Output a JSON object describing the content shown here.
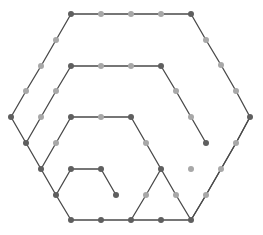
{
  "diagram": {
    "type": "hexagonal-spiral-path",
    "colors": {
      "edge": "#4a4a4a",
      "corner_node": "#5f5f5f",
      "mid_node": "#a8a8a8",
      "background": "#ffffff"
    },
    "path": [
      [
        116,
        195
      ],
      [
        101,
        169
      ],
      [
        71,
        169
      ],
      [
        56,
        195
      ],
      [
        71,
        220
      ],
      [
        101,
        220
      ],
      [
        131,
        220
      ],
      [
        161,
        220
      ],
      [
        191,
        220
      ],
      [
        206,
        195
      ],
      [
        221,
        169
      ],
      [
        236,
        143
      ],
      [
        250,
        117
      ],
      [
        236,
        91
      ],
      [
        221,
        65
      ],
      [
        206,
        40
      ],
      [
        191,
        14
      ],
      [
        161,
        14
      ],
      [
        131,
        14
      ],
      [
        101,
        14
      ],
      [
        71,
        14
      ],
      [
        56,
        40
      ],
      [
        41,
        66
      ],
      [
        26,
        91
      ],
      [
        11,
        117
      ],
      [
        26,
        143
      ],
      [
        41,
        169
      ],
      [
        56,
        195
      ]
    ],
    "path2": [
      [
        131,
        220
      ],
      [
        146,
        195
      ],
      [
        161,
        169
      ],
      [
        176,
        195
      ],
      [
        191,
        220
      ]
    ],
    "rings": [
      [
        [
          161,
          169
        ],
        [
          146,
          143
        ],
        [
          131,
          117
        ],
        [
          101,
          117
        ],
        [
          71,
          117
        ],
        [
          56,
          143
        ],
        [
          41,
          169
        ]
      ],
      [
        [
          191,
          220
        ],
        [
          206,
          195
        ],
        [
          221,
          169
        ],
        [
          236,
          143
        ],
        [
          250,
          117
        ]
      ],
      [
        [
          206,
          143
        ],
        [
          191,
          117
        ],
        [
          176,
          91
        ],
        [
          161,
          66
        ],
        [
          131,
          66
        ],
        [
          101,
          66
        ],
        [
          71,
          66
        ],
        [
          56,
          91
        ],
        [
          41,
          117
        ],
        [
          26,
          143
        ]
      ]
    ],
    "nodes": [
      {
        "x": 71,
        "y": 14,
        "kind": "dark"
      },
      {
        "x": 101,
        "y": 14,
        "kind": "light"
      },
      {
        "x": 131,
        "y": 14,
        "kind": "light"
      },
      {
        "x": 161,
        "y": 14,
        "kind": "light"
      },
      {
        "x": 191,
        "y": 14,
        "kind": "dark"
      },
      {
        "x": 206,
        "y": 40,
        "kind": "light"
      },
      {
        "x": 221,
        "y": 65,
        "kind": "light"
      },
      {
        "x": 236,
        "y": 91,
        "kind": "light"
      },
      {
        "x": 250,
        "y": 117,
        "kind": "dark"
      },
      {
        "x": 236,
        "y": 143,
        "kind": "light"
      },
      {
        "x": 221,
        "y": 169,
        "kind": "light"
      },
      {
        "x": 206,
        "y": 195,
        "kind": "light"
      },
      {
        "x": 56,
        "y": 40,
        "kind": "light"
      },
      {
        "x": 41,
        "y": 66,
        "kind": "light"
      },
      {
        "x": 26,
        "y": 91,
        "kind": "light"
      },
      {
        "x": 11,
        "y": 117,
        "kind": "dark"
      },
      {
        "x": 26,
        "y": 143,
        "kind": "dark"
      },
      {
        "x": 41,
        "y": 169,
        "kind": "dark"
      },
      {
        "x": 56,
        "y": 195,
        "kind": "dark"
      },
      {
        "x": 71,
        "y": 66,
        "kind": "dark"
      },
      {
        "x": 101,
        "y": 66,
        "kind": "light"
      },
      {
        "x": 131,
        "y": 66,
        "kind": "light"
      },
      {
        "x": 161,
        "y": 66,
        "kind": "dark"
      },
      {
        "x": 176,
        "y": 91,
        "kind": "light"
      },
      {
        "x": 191,
        "y": 117,
        "kind": "light"
      },
      {
        "x": 206,
        "y": 143,
        "kind": "dark"
      },
      {
        "x": 191,
        "y": 169,
        "kind": "light"
      },
      {
        "x": 176,
        "y": 195,
        "kind": "light"
      },
      {
        "x": 56,
        "y": 91,
        "kind": "light"
      },
      {
        "x": 41,
        "y": 117,
        "kind": "light"
      },
      {
        "x": 71,
        "y": 117,
        "kind": "dark"
      },
      {
        "x": 101,
        "y": 117,
        "kind": "light"
      },
      {
        "x": 131,
        "y": 117,
        "kind": "dark"
      },
      {
        "x": 146,
        "y": 143,
        "kind": "light"
      },
      {
        "x": 161,
        "y": 169,
        "kind": "dark"
      },
      {
        "x": 146,
        "y": 195,
        "kind": "light"
      },
      {
        "x": 56,
        "y": 143,
        "kind": "light"
      },
      {
        "x": 71,
        "y": 169,
        "kind": "dark"
      },
      {
        "x": 101,
        "y": 169,
        "kind": "dark"
      },
      {
        "x": 116,
        "y": 195,
        "kind": "dark"
      },
      {
        "x": 71,
        "y": 220,
        "kind": "dark"
      },
      {
        "x": 101,
        "y": 220,
        "kind": "dark"
      },
      {
        "x": 131,
        "y": 220,
        "kind": "dark"
      },
      {
        "x": 161,
        "y": 220,
        "kind": "dark"
      },
      {
        "x": 191,
        "y": 220,
        "kind": "dark"
      }
    ]
  }
}
